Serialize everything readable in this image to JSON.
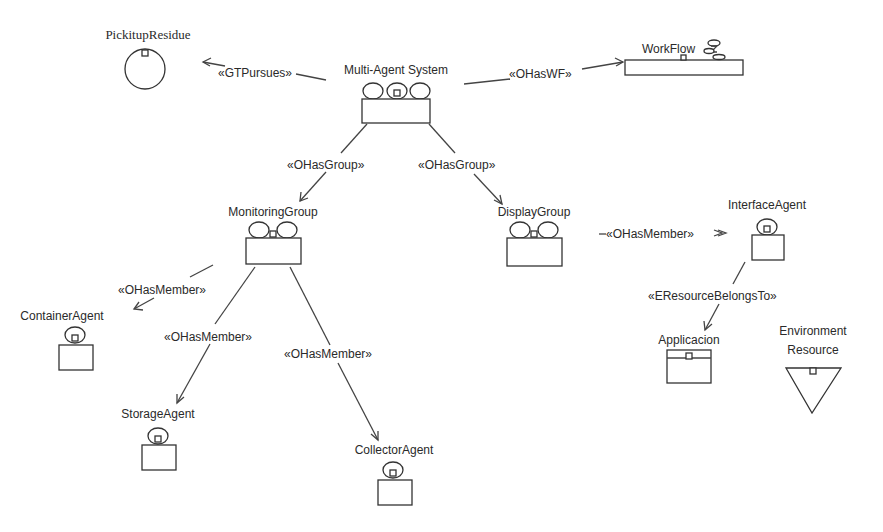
{
  "diagram": {
    "type": "INGENIAS multi-agent organization diagram",
    "nodes": [
      {
        "id": "pickitup",
        "label": "PickitupResidue",
        "kind": "goal",
        "x": 148,
        "y": 72
      },
      {
        "id": "mas",
        "label": "Multi-Agent System",
        "kind": "organization",
        "x": 396,
        "y": 86
      },
      {
        "id": "workflow",
        "label": "WorkFlow",
        "kind": "workflow",
        "x": 682,
        "y": 67
      },
      {
        "id": "monitoring",
        "label": "MonitoringGroup",
        "kind": "group",
        "x": 272,
        "y": 242
      },
      {
        "id": "display",
        "label": "DisplayGroup",
        "kind": "group",
        "x": 532,
        "y": 242
      },
      {
        "id": "interface",
        "label": "InterfaceAgent",
        "kind": "agent",
        "x": 767,
        "y": 240
      },
      {
        "id": "container",
        "label": "ContainerAgent",
        "kind": "agent",
        "x": 75,
        "y": 345
      },
      {
        "id": "storage",
        "label": "StorageAgent",
        "kind": "agent",
        "x": 158,
        "y": 443
      },
      {
        "id": "collector",
        "label": "CollectorAgent",
        "kind": "agent",
        "x": 394,
        "y": 478
      },
      {
        "id": "applicacion",
        "label": "Applicacion",
        "kind": "application",
        "x": 689,
        "y": 367
      },
      {
        "id": "env_resource",
        "label_line1": "Environment",
        "label_line2": "Resource",
        "kind": "resource",
        "x": 813,
        "y": 392
      }
    ],
    "edges": [
      {
        "from": "mas",
        "to": "pickitup",
        "label": "«GTPursues»"
      },
      {
        "from": "mas",
        "to": "workflow",
        "label": "«OHasWF»"
      },
      {
        "from": "mas",
        "to": "monitoring",
        "label": "«OHasGroup»"
      },
      {
        "from": "mas",
        "to": "display",
        "label": "«OHasGroup»"
      },
      {
        "from": "display",
        "to": "interface",
        "label": "«OHasMember»"
      },
      {
        "from": "monitoring",
        "to": "container",
        "label": "«OHasMember»"
      },
      {
        "from": "monitoring",
        "to": "storage",
        "label": "«OHasMember»"
      },
      {
        "from": "monitoring",
        "to": "collector",
        "label": "«OHasMember»"
      },
      {
        "from": "interface",
        "to": "applicacion",
        "label": "«EResourceBelongsTo»"
      }
    ]
  },
  "labels": {
    "pickitup": "PickitupResidue",
    "mas": "Multi-Agent System",
    "workflow": "WorkFlow",
    "monitoring": "MonitoringGroup",
    "display": "DisplayGroup",
    "interface": "InterfaceAgent",
    "container": "ContainerAgent",
    "storage": "StorageAgent",
    "collector": "CollectorAgent",
    "applicacion": "Applicacion",
    "env_line1": "Environment",
    "env_line2": "Resource"
  },
  "edge_labels": {
    "gtpursues": "«GTPursues»",
    "ohaswf": "«OHasWF»",
    "ohasgroup_left": "«OHasGroup»",
    "ohasgroup_right": "«OHasGroup»",
    "ohasmember_display": "«OHasMember»",
    "ohasmember_container": "«OHasMember»",
    "ohasmember_storage": "«OHasMember»",
    "ohasmember_collector": "«OHasMember»",
    "eresourcebelongsto": "«EResourceBelongsTo»"
  }
}
